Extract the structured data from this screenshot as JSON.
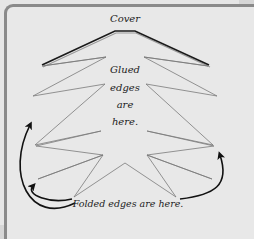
{
  "diagram": {
    "title": "Cover",
    "center_label_lines": [
      "Glued",
      "edges",
      "are",
      "here."
    ],
    "bottom_label": "Folded edges are here.",
    "colors": {
      "background": "#e8e8e8",
      "frame_border": "#8a8a8a",
      "cover_line": "#1a1a1a",
      "cover_shadow": "#9a9a9a",
      "zigzag_line": "#7a7a7a",
      "arrow": "#111111",
      "text": "#222222"
    }
  }
}
